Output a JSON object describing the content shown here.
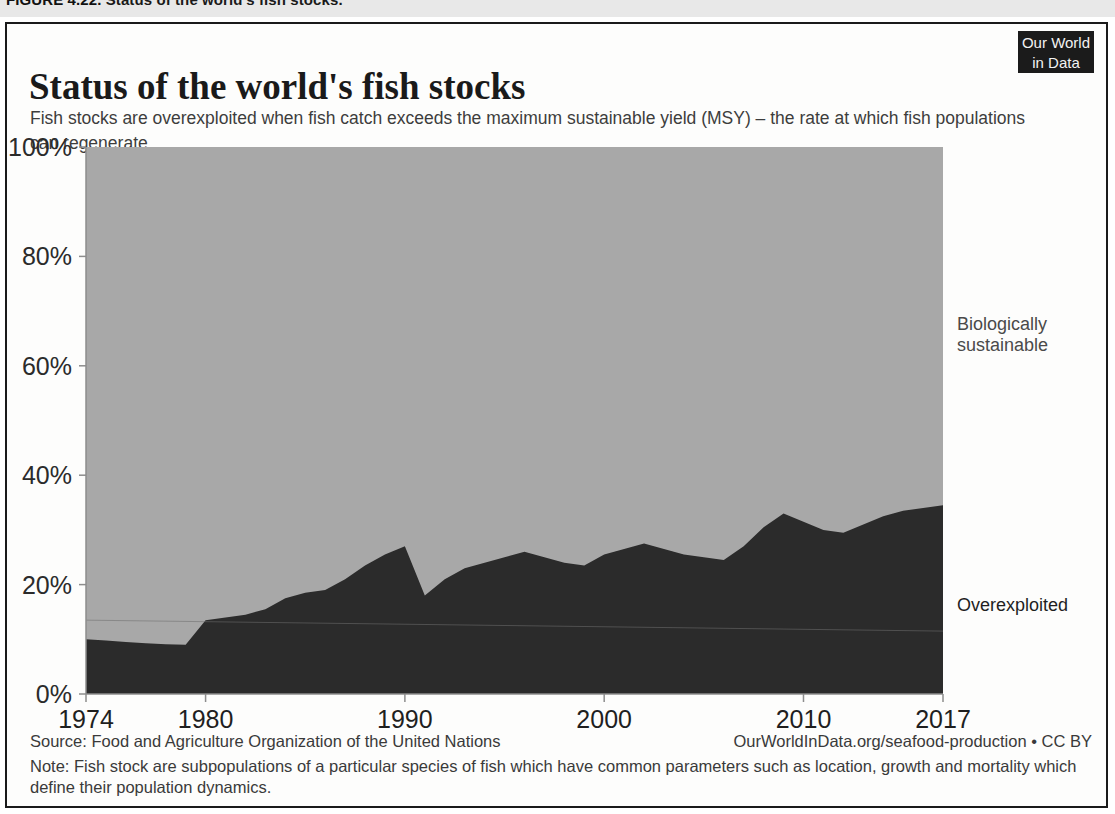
{
  "figure": {
    "number": "FIGURE 4.22.",
    "caption": "Status of the world's fish stocks."
  },
  "header": {
    "title": "Status of the world's fish stocks",
    "subtitle": "Fish stocks are overexploited when fish catch exceeds the maximum sustainable yield (MSY) – the rate at which fish populations can regenerate.",
    "logo_line1": "Our World",
    "logo_line2": "in Data"
  },
  "footer": {
    "source": "Source: Food and Agriculture Organization of the United Nations",
    "attribution": "OurWorldInData.org/seafood-production • CC BY",
    "note": "Note: Fish stock are subpopulations of a particular species of fish which have common parameters such as location, growth and mortality which define their population dynamics."
  },
  "colors": {
    "overexploited": "#2b2b2b",
    "sustainable": "#a8a8a8",
    "axis": "#8d8d8d",
    "card_border": "#1a1a1a",
    "logo_bg": "#1b1b1b"
  },
  "chart_data": {
    "type": "area",
    "stacked": true,
    "title": "Status of the world's fish stocks",
    "subtitle": "Fish stocks are overexploited when fish catch exceeds the maximum sustainable yield (MSY) – the rate at which fish populations can regenerate.",
    "xlabel": "",
    "ylabel": "",
    "xlim": [
      1974,
      2017
    ],
    "ylim": [
      0,
      100
    ],
    "grid": false,
    "legend_position": "right-inline",
    "y_ticks": [
      0,
      20,
      40,
      60,
      80,
      100
    ],
    "y_tick_labels": [
      "0%",
      "20%",
      "40%",
      "60%",
      "80%",
      "100%"
    ],
    "x_ticks": [
      1974,
      1980,
      1990,
      2000,
      2010,
      2017
    ],
    "x_tick_labels": [
      "1974",
      "1980",
      "1990",
      "2000",
      "2010",
      "2017"
    ],
    "x": [
      1974,
      1975,
      1976,
      1977,
      1978,
      1979,
      1980,
      1981,
      1982,
      1983,
      1984,
      1985,
      1986,
      1987,
      1988,
      1989,
      1990,
      1991,
      1992,
      1993,
      1994,
      1995,
      1996,
      1997,
      1998,
      1999,
      2000,
      2001,
      2002,
      2003,
      2004,
      2005,
      2006,
      2007,
      2008,
      2009,
      2010,
      2011,
      2012,
      2013,
      2014,
      2015,
      2017
    ],
    "series": [
      {
        "name": "Overexploited",
        "color": "#2b2b2b",
        "unit": "%",
        "values": [
          10.0,
          9.8,
          9.5,
          9.3,
          9.1,
          9.0,
          13.5,
          14.0,
          14.5,
          15.5,
          17.5,
          18.5,
          19.0,
          21.0,
          23.5,
          25.5,
          27.0,
          18.0,
          21.0,
          23.0,
          24.0,
          25.0,
          26.0,
          25.0,
          24.0,
          23.5,
          25.5,
          26.5,
          27.5,
          26.5,
          25.5,
          25.0,
          24.5,
          27.0,
          30.5,
          33.0,
          31.5,
          30.0,
          29.5,
          31.0,
          32.5,
          33.5,
          34.5
        ]
      },
      {
        "name": "Biologically sustainable",
        "color": "#a8a8a8",
        "unit": "%",
        "values": [
          90.0,
          90.2,
          90.5,
          90.7,
          90.9,
          91.0,
          86.5,
          86.0,
          85.5,
          84.5,
          82.5,
          81.5,
          81.0,
          79.0,
          76.5,
          74.5,
          73.0,
          82.0,
          79.0,
          77.0,
          76.0,
          75.0,
          74.0,
          75.0,
          76.0,
          76.5,
          74.5,
          73.5,
          72.5,
          73.5,
          74.5,
          75.0,
          75.5,
          73.0,
          69.5,
          67.0,
          68.5,
          70.0,
          70.5,
          69.0,
          67.5,
          66.5,
          65.5
        ]
      }
    ],
    "annotations": [
      {
        "text": "Biologically sustainable",
        "x": 2017,
        "y": 67
      },
      {
        "text": "Overexploited",
        "x": 2017,
        "y": 18
      }
    ]
  }
}
